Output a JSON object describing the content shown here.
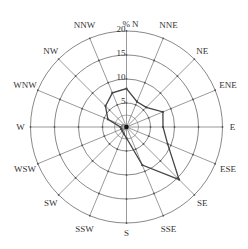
{
  "chart_data": {
    "type": "polar-line",
    "title": "",
    "radial_label": "%",
    "radial_ticks": [
      5,
      10,
      15,
      20
    ],
    "rlim": [
      0,
      20
    ],
    "grid": true,
    "categories": [
      "N",
      "NNE",
      "NE",
      "ENE",
      "E",
      "ESE",
      "SE",
      "SSE",
      "S",
      "SSW",
      "SW",
      "WSW",
      "W",
      "WNW",
      "NW",
      "NNW"
    ],
    "series": [
      {
        "name": "frequency",
        "values": [
          8.0,
          5.7,
          5.8,
          8.2,
          7.6,
          9.3,
          15.5,
          8.6,
          2.3,
          1.5,
          1.2,
          1.2,
          1.3,
          4.2,
          6.2,
          7.7
        ]
      }
    ]
  },
  "colors": {
    "grid": "#555555",
    "series": "#444444",
    "text": "#333333"
  }
}
